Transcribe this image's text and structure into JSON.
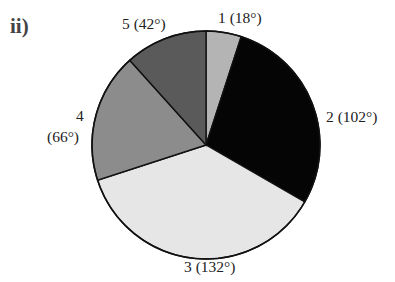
{
  "part_label": "ii)",
  "chart_data": {
    "type": "pie",
    "title": "",
    "unit": "degrees",
    "start_angle_deg": 0,
    "direction": "clockwise",
    "categories": [
      "1",
      "2",
      "3",
      "4",
      "5"
    ],
    "values": [
      18,
      102,
      132,
      66,
      42
    ],
    "labels": [
      "1 (18°)",
      "2 (102°)",
      "3 (132°)",
      "4 (66°)",
      "5 (42°)"
    ],
    "colors": [
      "#b4b4b4",
      "#050505",
      "#e6e6e6",
      "#8c8c8c",
      "#5a5a5a"
    ],
    "legend": "none"
  },
  "slice_labels": {
    "s1": "1 (18°)",
    "s2": "2 (102°)",
    "s3": "3 (132°)",
    "s4_line1": "4",
    "s4_line2": "(66°)",
    "s5": "5 (42°)"
  }
}
